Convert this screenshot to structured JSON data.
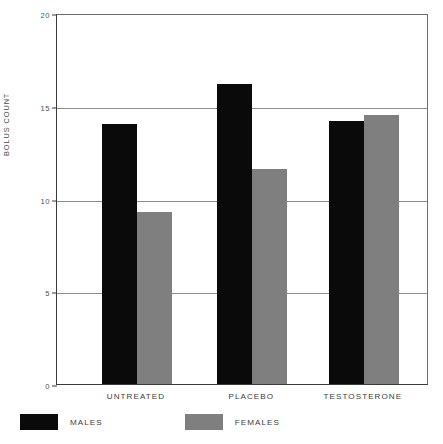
{
  "chart_data": {
    "type": "bar",
    "title": "",
    "xlabel": "",
    "ylabel": "BOLUS COUNT",
    "categories": [
      "UNTREATED",
      "PLACEBO",
      "TESTOSTERONE"
    ],
    "series": [
      {
        "name": "MALES",
        "color": "#0a0a0a",
        "values": [
          14.0,
          16.2,
          14.2
        ]
      },
      {
        "name": "FEMALES",
        "color": "#7f7f7f",
        "values": [
          9.3,
          11.6,
          14.5
        ]
      }
    ],
    "ylim": [
      0,
      20
    ],
    "yticks": [
      0,
      5,
      10,
      15,
      20
    ],
    "ytick_labels": [
      "0",
      "5",
      "10",
      "15",
      "20"
    ],
    "gridlines": [
      5,
      10,
      15
    ],
    "grid": true,
    "legend_position": "below-left"
  },
  "axis": {
    "y_title": "BOLUS COUNT",
    "tick_0": "0",
    "tick_5": "5",
    "tick_10": "10",
    "tick_15": "15",
    "tick_20": "20"
  },
  "categories": {
    "c0": "UNTREATED",
    "c1": "PLACEBO",
    "c2": "TESTOSTERONE"
  },
  "legend": {
    "males_label": "MALES",
    "females_label": "FEMALES"
  },
  "colors": {
    "males": "#0a0a0a",
    "females": "#7f7f7f",
    "grid": "#8d8d8d",
    "axis": "#3a3a3a",
    "background": "#ffffff"
  }
}
